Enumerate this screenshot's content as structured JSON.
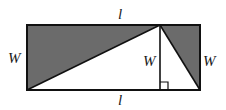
{
  "diagram": {
    "type": "geometry-figure",
    "colors": {
      "shade": "#6b6b6b",
      "stroke": "#111111",
      "background": "#ffffff",
      "label": "#1a1a1a"
    },
    "labels": {
      "top_length": "l",
      "bottom_length": "l",
      "left_width": "W",
      "height": "W",
      "right_width": "W"
    },
    "shapes": {
      "rectangle": {
        "x": 27,
        "y": 25,
        "width": 173,
        "height": 65
      },
      "triangle_apex": {
        "x": 160,
        "y": 25
      },
      "right_angle_marker": {
        "x": 160,
        "y": 82,
        "size": 8
      }
    }
  }
}
